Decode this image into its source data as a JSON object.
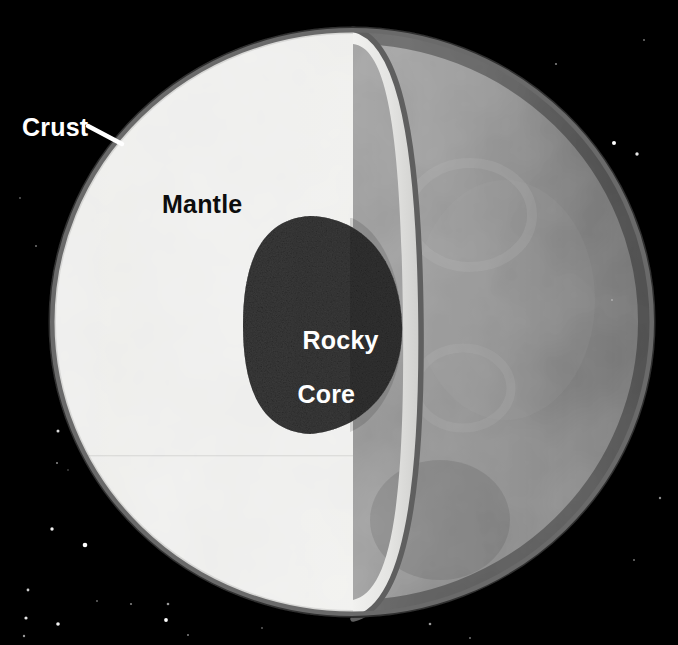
{
  "diagram": {
    "width": 678,
    "height": 645,
    "background_color": "#000000",
    "labels": {
      "crust": "Crust",
      "mantle": "Mantle",
      "core_line1": "Rocky",
      "core_line2": "Core"
    },
    "layers": [
      {
        "name": "crust",
        "label": "Crust",
        "color": "#6e6e6e",
        "text_color": "#ffffff",
        "description": "thin outer shell rim"
      },
      {
        "name": "mantle",
        "label": "Mantle",
        "color": "#e9e9e7",
        "text_color": "#0d0d0d",
        "description": "thick light cutaway interior"
      },
      {
        "name": "rocky-core",
        "label": "Rocky Core",
        "color": "#3a3a3a",
        "text_color": "#ffffff",
        "description": "dark grainy central sphere"
      },
      {
        "name": "surface",
        "label": "Surface",
        "color": "#8c8c8c",
        "text_color": "#ffffff",
        "description": "far hemisphere exterior of planet"
      }
    ],
    "leader_line": {
      "name": "crust-leader-line",
      "from_x": 88,
      "from_y": 126,
      "to_x": 122,
      "to_y": 144,
      "color": "#ffffff"
    },
    "planet": {
      "center_x": 352,
      "center_y": 322,
      "radius_x": 303,
      "radius_y": 295,
      "cut_plane_x": 353
    },
    "core": {
      "center_x": 310,
      "center_y": 325,
      "radius_x": 67,
      "radius_y": 110
    },
    "stars": [
      {
        "x": 58,
        "y": 431,
        "r": 1.5,
        "o": 0.85
      },
      {
        "x": 57,
        "y": 463,
        "r": 1.0,
        "o": 0.55
      },
      {
        "x": 68,
        "y": 470,
        "r": 0.8,
        "o": 0.4
      },
      {
        "x": 52,
        "y": 529,
        "r": 1.7,
        "o": 0.95
      },
      {
        "x": 85,
        "y": 545,
        "r": 2.3,
        "o": 1.0
      },
      {
        "x": 28,
        "y": 590,
        "r": 1.4,
        "o": 0.8
      },
      {
        "x": 97,
        "y": 601,
        "r": 0.9,
        "o": 0.45
      },
      {
        "x": 131,
        "y": 604,
        "r": 1.1,
        "o": 0.5
      },
      {
        "x": 168,
        "y": 604,
        "r": 1.3,
        "o": 0.6
      },
      {
        "x": 166,
        "y": 620,
        "r": 1.9,
        "o": 1.0
      },
      {
        "x": 26,
        "y": 618,
        "r": 1.6,
        "o": 0.9
      },
      {
        "x": 58,
        "y": 624,
        "r": 1.8,
        "o": 0.95
      },
      {
        "x": 24,
        "y": 636,
        "r": 1.2,
        "o": 0.6
      },
      {
        "x": 188,
        "y": 635,
        "r": 1.0,
        "o": 0.5
      },
      {
        "x": 107,
        "y": 137,
        "r": 1.0,
        "o": 0.45
      },
      {
        "x": 20,
        "y": 198,
        "r": 0.9,
        "o": 0.4
      },
      {
        "x": 36,
        "y": 246,
        "r": 1.0,
        "o": 0.45
      },
      {
        "x": 614,
        "y": 143,
        "r": 2.0,
        "o": 1.0
      },
      {
        "x": 637,
        "y": 154,
        "r": 1.7,
        "o": 0.9
      },
      {
        "x": 556,
        "y": 64,
        "r": 1.1,
        "o": 0.5
      },
      {
        "x": 644,
        "y": 40,
        "r": 1.0,
        "o": 0.45
      },
      {
        "x": 612,
        "y": 300,
        "r": 0.9,
        "o": 0.4
      },
      {
        "x": 660,
        "y": 498,
        "r": 1.2,
        "o": 0.55
      },
      {
        "x": 634,
        "y": 560,
        "r": 1.0,
        "o": 0.45
      },
      {
        "x": 430,
        "y": 624,
        "r": 1.3,
        "o": 0.6
      },
      {
        "x": 470,
        "y": 638,
        "r": 1.0,
        "o": 0.45
      },
      {
        "x": 262,
        "y": 628,
        "r": 0.9,
        "o": 0.4
      }
    ]
  }
}
